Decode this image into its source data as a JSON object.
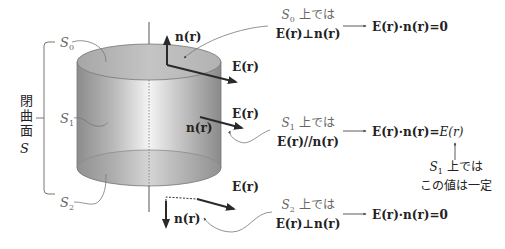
{
  "closed_surface": {
    "label_chars": "閉曲面",
    "symbol": "S"
  },
  "surfaces": [
    {
      "id": "S0",
      "letter": "S",
      "sub": "0"
    },
    {
      "id": "S1",
      "letter": "S",
      "sub": "1"
    },
    {
      "id": "S2",
      "letter": "S",
      "sub": "2"
    }
  ],
  "vectors": {
    "normal": "n(r)",
    "field": "E(r)"
  },
  "conditions": [
    {
      "surface_letter": "S",
      "surface_sub": "0",
      "suffix": " 上では",
      "relation": "E(r)⊥n(r)",
      "result": "E(r)·n(r)=0"
    },
    {
      "surface_letter": "S",
      "surface_sub": "1",
      "suffix": " 上では",
      "relation": "E(r)//n(r)",
      "result_prefix": "E(r)·n(r)=",
      "result_italic": "E(r)"
    },
    {
      "surface_letter": "S",
      "surface_sub": "2",
      "suffix": " 上では",
      "relation": "E(r)⊥n(r)",
      "result": "E(r)·n(r)=0"
    }
  ],
  "note": {
    "surface_letter": "S",
    "surface_sub": "1",
    "line1_suffix": " 上では",
    "line2": "この値は一定"
  },
  "colors": {
    "cylinder_dark": "#8a8a8a",
    "cylinder_light": "#f2f2f2",
    "top_face": "#b5b5b5",
    "arrow": "#2a2a2a",
    "leader": "#777777"
  }
}
